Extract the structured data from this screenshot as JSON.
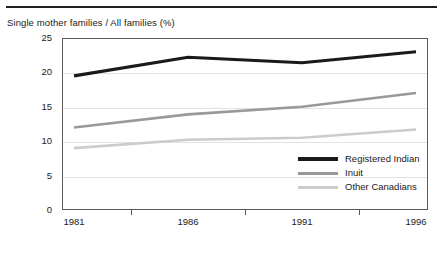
{
  "chart_data": {
    "type": "line",
    "title": "Single mother families / All families (%)",
    "xlabel": "",
    "ylabel": "",
    "x": [
      1981,
      1986,
      1991,
      1996
    ],
    "categories": [
      "1981",
      "1986",
      "1991",
      "1996"
    ],
    "xticklabels": [
      "1981",
      "1986",
      "1991",
      "1996"
    ],
    "yticklabels": [
      "0",
      "5",
      "10",
      "15",
      "20",
      "25"
    ],
    "yticks": [
      0,
      5,
      10,
      15,
      20,
      25
    ],
    "ylim": [
      0,
      25
    ],
    "grid": true,
    "legend_position": "inside-lower-right",
    "series": [
      {
        "name": "Registered Indian",
        "color": "#1a1a1a",
        "width": 3.2,
        "values": [
          19.5,
          22.2,
          21.4,
          23.0
        ]
      },
      {
        "name": "Inuit",
        "color": "#999999",
        "width": 2.6,
        "values": [
          12.0,
          13.9,
          15.0,
          17.0
        ]
      },
      {
        "name": "Other Canadians",
        "color": "#cccccc",
        "width": 2.6,
        "values": [
          9.0,
          10.2,
          10.5,
          11.7
        ]
      }
    ]
  },
  "legend": {
    "items": [
      {
        "label": "Registered Indian"
      },
      {
        "label": "Inuit"
      },
      {
        "label": "Other Canadians"
      }
    ]
  }
}
